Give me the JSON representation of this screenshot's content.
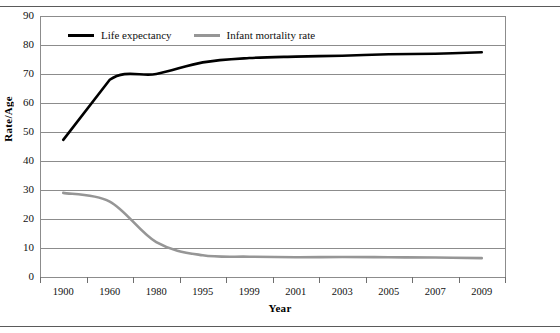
{
  "chart_data": {
    "type": "line",
    "title": "",
    "xlabel": "Year",
    "ylabel": "Rate/Age",
    "categories": [
      "1900",
      "1960",
      "1980",
      "1995",
      "1999",
      "2001",
      "2003",
      "2005",
      "2007",
      "2009"
    ],
    "ylim": [
      0,
      90
    ],
    "ytick_step": 10,
    "yticks": [
      "90",
      "80",
      "70",
      "60",
      "50",
      "40",
      "30",
      "20",
      "10",
      "0"
    ],
    "grid": true,
    "legend_position": "top-left",
    "series": [
      {
        "name": "Life expectancy",
        "color": "#000000",
        "values": [
          47.3,
          68.0,
          70.0,
          74.0,
          75.5,
          76.0,
          76.3,
          76.8,
          77.0,
          77.5
        ]
      },
      {
        "name": "Infant mortality rate",
        "color": "#969696",
        "values": [
          29.0,
          26.0,
          12.0,
          7.5,
          7.0,
          6.8,
          6.9,
          6.8,
          6.7,
          6.5
        ]
      }
    ]
  },
  "legend": {
    "items": [
      {
        "label": "Life expectancy",
        "color": "#000000"
      },
      {
        "label": "Infant mortality rate",
        "color": "#969696"
      }
    ]
  },
  "axes": {
    "x_title": "Year",
    "y_title": "Rate/Age"
  }
}
